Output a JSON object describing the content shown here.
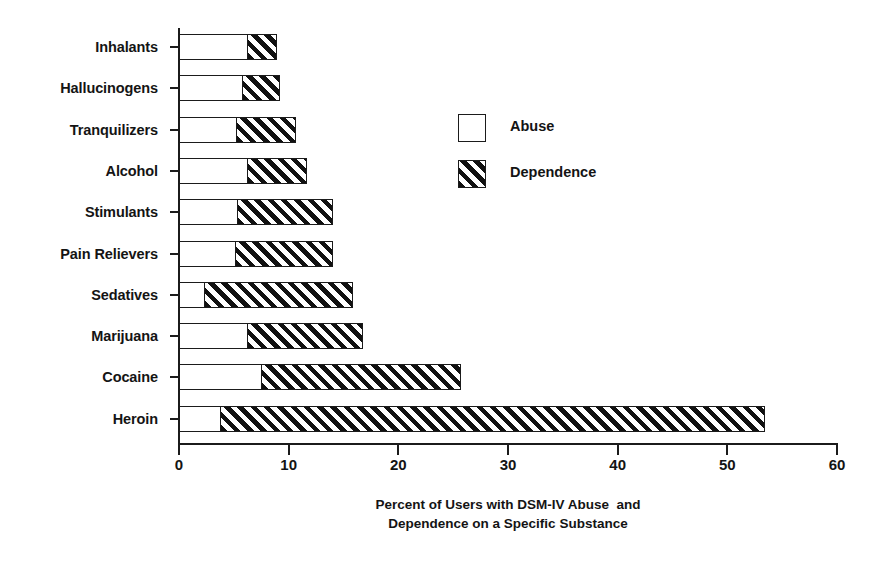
{
  "chart_data": {
    "type": "bar",
    "orientation": "horizontal",
    "stacked": true,
    "title": "",
    "xlabel": "Percent of Users with DSM-IV Abuse  and Dependence on a Specific Substance",
    "xlabel_line1": "Percent of Users with DSM-IV Abuse  and",
    "xlabel_line2": "Dependence on a Specific Substance",
    "ylabel": "",
    "xlim": [
      0,
      60
    ],
    "xticks": [
      0,
      10,
      20,
      30,
      40,
      50,
      60
    ],
    "xtick_labels": [
      "0",
      "10",
      "20",
      "30",
      "40",
      "50",
      "60"
    ],
    "grid": false,
    "legend_position": "upper center",
    "categories": [
      "Inhalants",
      "Hallucinogens",
      "Tranquilizers",
      "Alcohol",
      "Stimulants",
      "Pain Relievers",
      "Sedatives",
      "Marijuana",
      "Cocaine",
      "Heroin"
    ],
    "series": [
      {
        "name": "Abuse",
        "fill": "white",
        "values": [
          6.3,
          5.9,
          5.3,
          6.3,
          5.4,
          5.2,
          2.4,
          6.3,
          7.6,
          3.9
        ]
      },
      {
        "name": "Dependence",
        "fill": "diagonal-hatch",
        "values": [
          2.6,
          3.3,
          5.4,
          5.4,
          8.6,
          8.8,
          13.5,
          10.5,
          18.1,
          49.5
        ]
      }
    ],
    "totals": [
      8.9,
      9.2,
      10.7,
      11.7,
      14.0,
      14.0,
      15.9,
      16.8,
      25.7,
      53.4
    ]
  },
  "legend": {
    "items": [
      {
        "label": "Abuse",
        "swatch": "white-square"
      },
      {
        "label": "Dependence",
        "swatch": "hatched-square"
      }
    ]
  },
  "colors": {
    "axis": "#1b1b1b",
    "text": "#141414",
    "bar_fill_abuse": "#ffffff",
    "bar_hatch": "#111111",
    "background": "#ffffff"
  }
}
